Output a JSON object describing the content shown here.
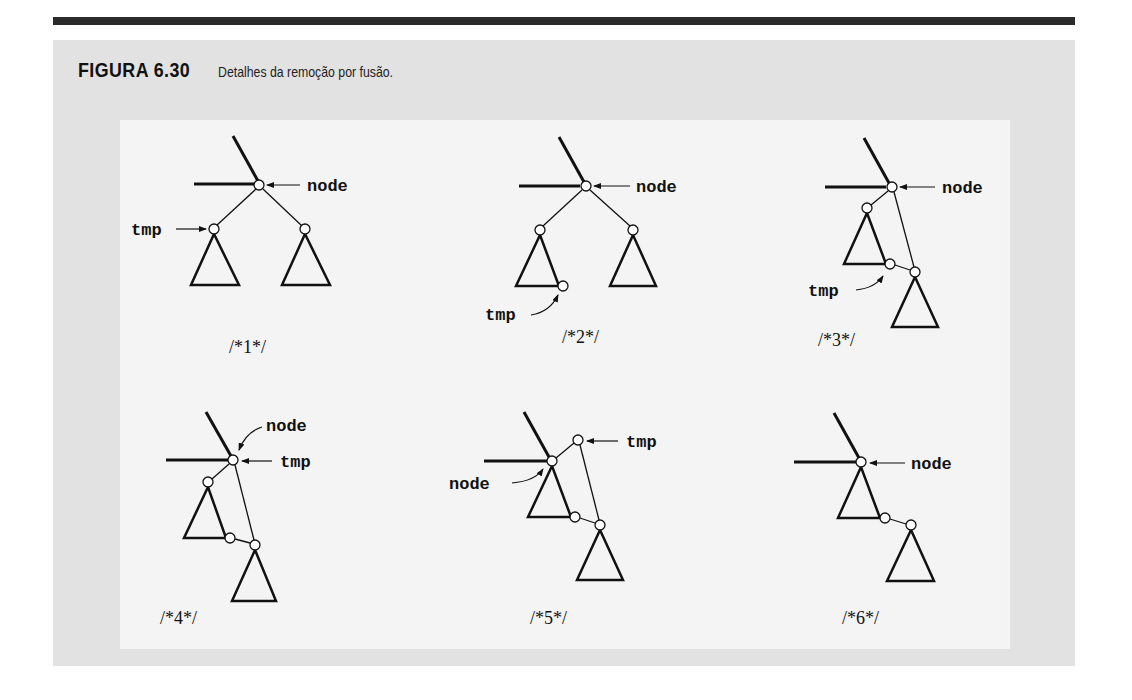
{
  "figure": {
    "number": "FIGURA 6.30",
    "caption": "Detalhes da remoção por fusão."
  },
  "diagrams": [
    {
      "step": "/*1*/",
      "labels": {
        "node": "node",
        "tmp": "tmp"
      }
    },
    {
      "step": "/*2*/",
      "labels": {
        "node": "node",
        "tmp": "tmp"
      }
    },
    {
      "step": "/*3*/",
      "labels": {
        "node": "node",
        "tmp": "tmp"
      }
    },
    {
      "step": "/*4*/",
      "labels": {
        "node": "node",
        "tmp": "tmp"
      }
    },
    {
      "step": "/*5*/",
      "labels": {
        "node": "node",
        "tmp": "tmp"
      }
    },
    {
      "step": "/*6*/",
      "labels": {
        "node": "node"
      }
    }
  ],
  "colors": {
    "panel": "#e2e2e2",
    "inner": "#f4f4f4",
    "ink": "#111111"
  }
}
